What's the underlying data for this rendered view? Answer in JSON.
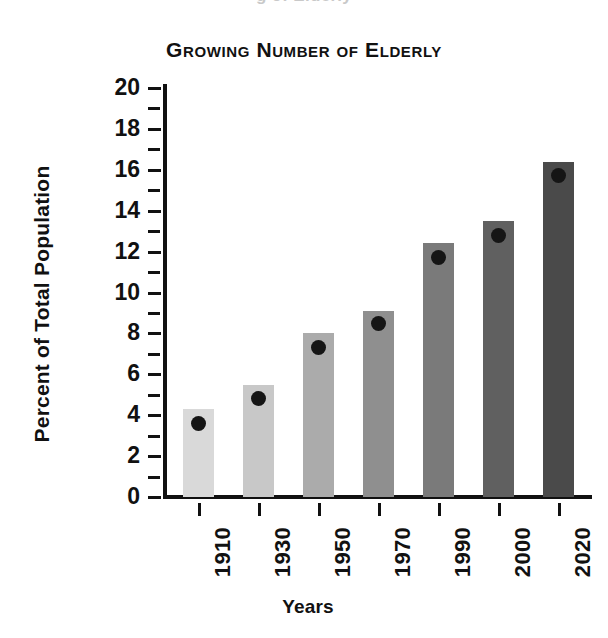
{
  "scan_bleed_text": "g of Elderly",
  "chart_data": {
    "type": "bar",
    "title": "Growing Number of Elderly",
    "xlabel": "Years",
    "ylabel": "Percent of Total Population",
    "categories": [
      "1910",
      "1930",
      "1950",
      "1970",
      "1990",
      "2000",
      "2020"
    ],
    "values": [
      4.3,
      5.5,
      8.0,
      9.1,
      12.4,
      13.5,
      16.4
    ],
    "marker_values": [
      3.6,
      4.8,
      7.3,
      8.5,
      11.7,
      12.8,
      15.7
    ],
    "series": [
      {
        "name": "Percent of Total Population",
        "values": [
          4.3,
          5.5,
          8.0,
          9.1,
          12.4,
          13.5,
          16.4
        ]
      }
    ],
    "bar_colors": [
      "#d9d9d9",
      "#c8c8c8",
      "#ababab",
      "#8f8f8f",
      "#7a7a7a",
      "#606060",
      "#4a4a4a"
    ],
    "marker_color": "#151515",
    "ylim": [
      0,
      20
    ],
    "ytick_major": [
      20,
      18,
      16,
      14,
      12,
      10,
      8,
      6,
      4,
      2,
      0
    ],
    "ytick_minor": [
      19,
      17,
      15,
      13,
      11,
      9,
      7,
      5,
      3,
      1
    ],
    "ytick_labels": [
      "20",
      "18",
      "16",
      "14",
      "12",
      "10",
      "8",
      "6",
      "4",
      "2",
      "0"
    ],
    "grid": false,
    "legend": "none",
    "axis_color": "#111111"
  }
}
